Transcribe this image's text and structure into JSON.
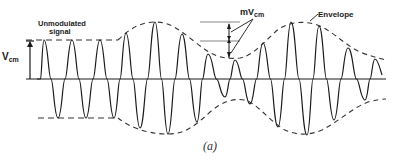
{
  "figure": {
    "caption": "(a)",
    "labels": {
      "unmodulated_line1": "Unmodulated",
      "unmodulated_line2": "signal",
      "vcm_main": "V",
      "vcm_sub": "cm",
      "mvcm_main": "mV",
      "mvcm_sub": "cm",
      "envelope": "Envelope"
    },
    "colors": {
      "stroke": "#1a1a1a",
      "dashed": "#333333",
      "background": "#ffffff"
    }
  },
  "diagram_data": {
    "type": "amplitude-modulated-waveform",
    "axis_y": 79,
    "unmodulated_amplitude_px": 39,
    "carrier_period_px": 28,
    "peaks": [
      {
        "x": 44,
        "y": 40
      },
      {
        "x": 72,
        "y": 40
      },
      {
        "x": 100,
        "y": 40
      },
      {
        "x": 126,
        "y": 33
      },
      {
        "x": 155,
        "y": 22
      },
      {
        "x": 182,
        "y": 34
      },
      {
        "x": 208,
        "y": 54
      },
      {
        "x": 235,
        "y": 60
      },
      {
        "x": 263,
        "y": 43
      },
      {
        "x": 291,
        "y": 22
      },
      {
        "x": 319,
        "y": 26
      },
      {
        "x": 348,
        "y": 48
      },
      {
        "x": 375,
        "y": 59
      }
    ],
    "troughs": [
      {
        "x": 58,
        "y": 118
      },
      {
        "x": 86,
        "y": 118
      },
      {
        "x": 114,
        "y": 118
      },
      {
        "x": 140,
        "y": 128
      },
      {
        "x": 168,
        "y": 134
      },
      {
        "x": 197,
        "y": 122
      },
      {
        "x": 225,
        "y": 97
      },
      {
        "x": 250,
        "y": 104
      },
      {
        "x": 278,
        "y": 127
      },
      {
        "x": 307,
        "y": 135
      },
      {
        "x": 334,
        "y": 120
      },
      {
        "x": 365,
        "y": 100
      }
    ]
  }
}
